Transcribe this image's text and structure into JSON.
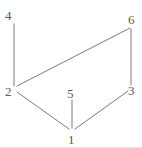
{
  "figure": {
    "width": 142,
    "height": 148,
    "background_color": "#ffffff",
    "edge_color": "#7a7a7a",
    "label_color": "#5a5a5a",
    "edge_width": 1
  },
  "chart_data": {
    "type": "diagram",
    "subtype": "node-link-graph",
    "title": "",
    "directed": false,
    "nodes": [
      {
        "id": "1",
        "label": "1",
        "x": 72,
        "y": 130,
        "label_x": 68,
        "label_y": 133
      },
      {
        "id": "2",
        "label": "2",
        "x": 14,
        "y": 88,
        "label_x": 5,
        "label_y": 85
      },
      {
        "id": "3",
        "label": "3",
        "x": 131,
        "y": 87,
        "label_x": 128,
        "label_y": 84
      },
      {
        "id": "4",
        "label": "4",
        "x": 14,
        "y": 22,
        "label_x": 5,
        "label_y": 9
      },
      {
        "id": "5",
        "label": "5",
        "x": 72,
        "y": 99,
        "label_x": 67,
        "label_y": 87
      },
      {
        "id": "6",
        "label": "6",
        "x": 131,
        "y": 26,
        "label_x": 128,
        "label_y": 13
      }
    ],
    "edges": [
      {
        "source": "4",
        "target": "2",
        "x1": 14,
        "y1": 24,
        "x2": 14,
        "y2": 86
      },
      {
        "source": "2",
        "target": "6",
        "x1": 17,
        "y1": 86,
        "x2": 130,
        "y2": 28
      },
      {
        "source": "6",
        "target": "3",
        "x1": 131,
        "y1": 29,
        "x2": 131,
        "y2": 85
      },
      {
        "source": "2",
        "target": "1",
        "x1": 17,
        "y1": 92,
        "x2": 69,
        "y2": 129
      },
      {
        "source": "3",
        "target": "1",
        "x1": 128,
        "y1": 91,
        "x2": 75,
        "y2": 129
      },
      {
        "source": "5",
        "target": "1",
        "x1": 72,
        "y1": 100,
        "x2": 72,
        "y2": 128
      }
    ],
    "node_count": 6,
    "edge_count": 6
  }
}
